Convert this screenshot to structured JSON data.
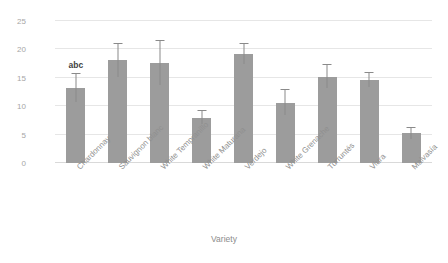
{
  "chart_data": {
    "type": "bar",
    "title": "",
    "xlabel": "Variety",
    "ylabel": "GSH (µg/g)",
    "categories": [
      "Chardonnay",
      "Sauvignon blanc",
      "White Tempranillo",
      "White Maturana",
      "Verdejo",
      "White Grenache",
      "Turruntés",
      "Viura",
      "Malvasía"
    ],
    "values": [
      13.2,
      18.1,
      17.6,
      8.0,
      19.2,
      10.6,
      15.2,
      14.6,
      5.2
    ],
    "errors": [
      2.4,
      2.9,
      3.8,
      1.2,
      1.8,
      2.2,
      2.0,
      1.2,
      0.9
    ],
    "ylim": [
      0,
      25
    ],
    "yticks": [
      0,
      5,
      10,
      15,
      20,
      25
    ],
    "ytick_labels": [
      "0",
      "5",
      "10",
      "15",
      "20",
      "25"
    ],
    "grid": true,
    "legend": "none",
    "annotations": [
      {
        "category": "Chardonnay",
        "text": "abc"
      }
    ],
    "bar_color": "#9c9c9c",
    "error_color": "#8a8a8a",
    "grid_color": "#e6e6e6",
    "text_color": "#8c8c8c"
  }
}
